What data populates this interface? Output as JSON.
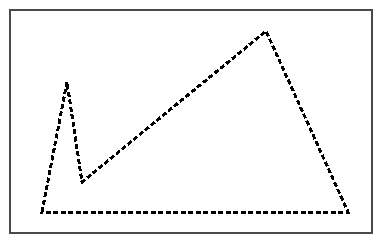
{
  "figure": {
    "kind": "line-drawing",
    "canvas": {
      "width": 387,
      "height": 245,
      "background_color": "#ffffff"
    },
    "frame": {
      "name": "outer-border",
      "x": 10,
      "y": 10,
      "width": 362,
      "height": 223,
      "stroke_color": "#4a4a4a",
      "stroke_width": 1.5,
      "fill_color": "#ffffff"
    },
    "polygon": {
      "name": "dashed-polygon",
      "stroke_color": "#000000",
      "stroke_width": 3,
      "fill_color": "none",
      "dash_length": 5,
      "dash_gap": 2.5,
      "closed": true,
      "vertex_count": 5,
      "points": "42,212 67,82 82,182 266,31 348,212",
      "vertices": [
        {
          "label": "bottom-left-base",
          "x": 42,
          "y": 212
        },
        {
          "label": "left-spike-apex",
          "x": 67,
          "y": 82
        },
        {
          "label": "valley-notch",
          "x": 82,
          "y": 182
        },
        {
          "label": "main-summit",
          "x": 266,
          "y": 31
        },
        {
          "label": "bottom-right-base",
          "x": 348,
          "y": 212
        }
      ],
      "edges": [
        {
          "label": "left-ascent",
          "from": "bottom-left-base",
          "to": "left-spike-apex"
        },
        {
          "label": "spike-descent",
          "from": "left-spike-apex",
          "to": "valley-notch"
        },
        {
          "label": "long-ascent",
          "from": "valley-notch",
          "to": "main-summit"
        },
        {
          "label": "summit-descent",
          "from": "main-summit",
          "to": "bottom-right-base"
        },
        {
          "label": "baseline",
          "from": "bottom-right-base",
          "to": "bottom-left-base"
        }
      ]
    }
  }
}
